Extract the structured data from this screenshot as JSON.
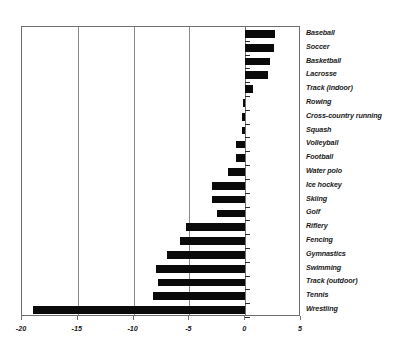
{
  "chart_data": {
    "type": "bar",
    "orientation": "horizontal",
    "title": "",
    "subtitle": "",
    "xlabel": "",
    "ylabel": "",
    "xlim": [
      -20,
      5
    ],
    "xticks": [
      -20,
      -15,
      -10,
      -5,
      0,
      5
    ],
    "xtick_labels": [
      "-20",
      "-15",
      "-10",
      "-5",
      "0",
      "5"
    ],
    "grid": true,
    "grid_axis": "x",
    "legend": false,
    "bar_color": "#0a0a0a",
    "categories": [
      "Baseball",
      "Soccer",
      "Basketball",
      "Lacrosse",
      "Track (indoor)",
      "Rowing",
      "Cross-country running",
      "Squash",
      "Volleyball",
      "Football",
      "Water polo",
      "Ice hockey",
      "Skiing",
      "Golf",
      "Riflery",
      "Fencing",
      "Gymnastics",
      "Swimming",
      "Track (outdoor)",
      "Tennis",
      "Wrestling"
    ],
    "values": [
      2.7,
      2.6,
      2.2,
      2.0,
      0.7,
      -0.2,
      -0.3,
      -0.3,
      -0.8,
      -0.8,
      -1.5,
      -3.0,
      -3.0,
      -2.5,
      -5.3,
      -5.8,
      -7.0,
      -8.0,
      -7.8,
      -8.3,
      -19.0
    ]
  }
}
